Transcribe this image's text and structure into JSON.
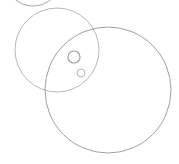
{
  "diagram": {
    "background": "#ffffff",
    "circles": [
      {
        "name": "top-arc-circle",
        "cx": 33,
        "cy": -22,
        "r": 28,
        "stroke": "#a8a8a8",
        "width": 1
      },
      {
        "name": "medium-circle",
        "cx": 57,
        "cy": 50,
        "r": 42,
        "stroke": "#b8b8b8",
        "width": 1
      },
      {
        "name": "large-circle",
        "cx": 108,
        "cy": 90,
        "r": 63,
        "stroke": "#a0a0a0",
        "width": 1
      },
      {
        "name": "small-circle-1",
        "cx": 74,
        "cy": 57,
        "r": 6,
        "stroke": "#a0a0a0",
        "width": 1.2
      },
      {
        "name": "small-circle-2",
        "cx": 81,
        "cy": 73,
        "r": 4,
        "stroke": "#b4b4b4",
        "width": 1
      }
    ]
  }
}
